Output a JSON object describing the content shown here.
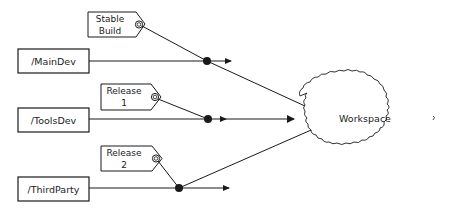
{
  "diagram": {
    "branches": [
      {
        "id": "maindev",
        "label": "/MainDev"
      },
      {
        "id": "toolsdev",
        "label": "/ToolsDev"
      },
      {
        "id": "thirdparty",
        "label": "/ThirdParty"
      }
    ],
    "labels": [
      {
        "id": "stable",
        "line1": "Stable",
        "line2": "Build"
      },
      {
        "id": "release1",
        "line1": "Release",
        "line2": "1"
      },
      {
        "id": "release2",
        "line1": "Release",
        "line2": "2"
      }
    ],
    "workspace": {
      "label": "Workspace"
    },
    "colors": {
      "stroke": "#1a1a1a",
      "fill": "#ffffff"
    }
  }
}
